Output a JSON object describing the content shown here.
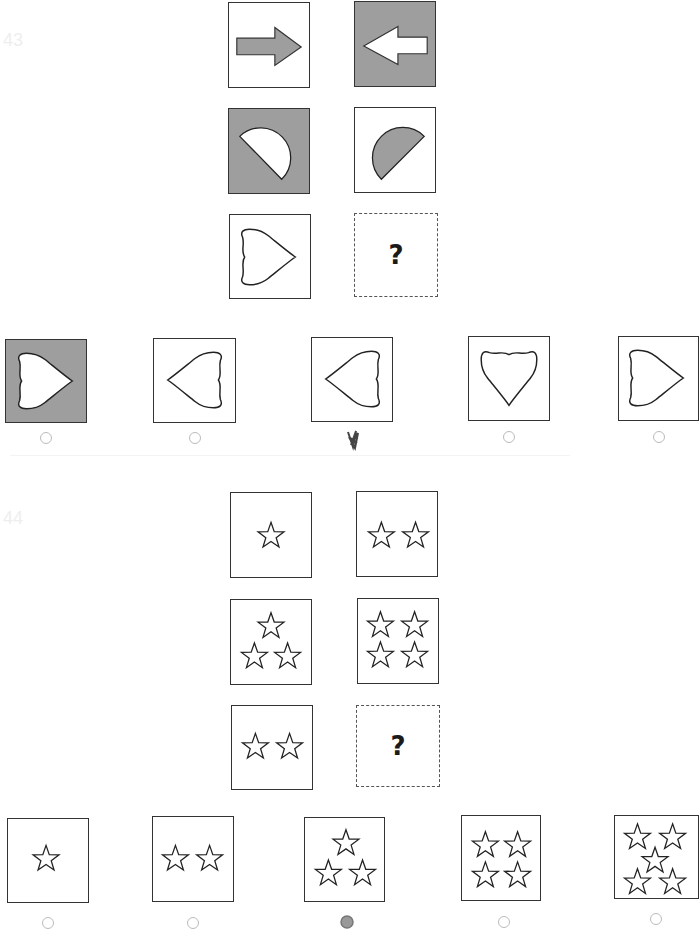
{
  "questions": [
    {
      "number": "43",
      "matrix": [
        {
          "shape": "arrow-right",
          "fill": "gray",
          "bg": "white"
        },
        {
          "shape": "arrow-left",
          "fill": "white",
          "bg": "gray"
        },
        {
          "shape": "half-circle-down-right",
          "fill": "white",
          "bg": "gray"
        },
        {
          "shape": "half-circle-up-left",
          "fill": "gray",
          "bg": "white"
        },
        {
          "shape": "heart-pointing-right",
          "fill": "white",
          "bg": "white"
        },
        {
          "shape": "question",
          "label": "?"
        }
      ],
      "options": [
        {
          "shape": "heart-pointing-right",
          "bg": "gray",
          "selected": false
        },
        {
          "shape": "heart-pointing-left",
          "bg": "white",
          "selected": false
        },
        {
          "shape": "heart-pointing-left",
          "bg": "white",
          "selected": true
        },
        {
          "shape": "heart-pointing-up",
          "bg": "white",
          "selected": false
        },
        {
          "shape": "heart-pointing-right",
          "bg": "white",
          "selected": false
        }
      ]
    },
    {
      "number": "44",
      "matrix": [
        {
          "shape": "stars",
          "count": 1
        },
        {
          "shape": "stars",
          "count": 2
        },
        {
          "shape": "stars",
          "count": 3
        },
        {
          "shape": "stars",
          "count": 4
        },
        {
          "shape": "stars",
          "count": 2
        },
        {
          "shape": "question",
          "label": "?"
        }
      ],
      "options": [
        {
          "shape": "stars",
          "count": 1,
          "selected": false
        },
        {
          "shape": "stars",
          "count": 2,
          "selected": false
        },
        {
          "shape": "stars",
          "count": 3,
          "selected": true
        },
        {
          "shape": "stars",
          "count": 4,
          "selected": false
        },
        {
          "shape": "stars",
          "count": 5,
          "selected": false
        }
      ]
    }
  ],
  "colors": {
    "tile_gray": "#9e9e9e",
    "stroke": "#333333",
    "radio": "#bbbbbb"
  }
}
